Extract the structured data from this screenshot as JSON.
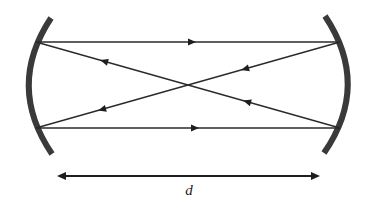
{
  "diagram": {
    "type": "optical-resonator",
    "dimension_label": "d",
    "colors": {
      "mirror": "#3a3a3a",
      "ray": "#2a2a2a",
      "background": "#ffffff"
    },
    "mirrors": [
      {
        "name": "left-mirror",
        "side": "left",
        "concave_toward": "right"
      },
      {
        "name": "right-mirror",
        "side": "right",
        "concave_toward": "left"
      }
    ],
    "rays": [
      {
        "name": "top-ray",
        "from": "left-mirror-top",
        "to": "right-mirror-top",
        "direction": "right"
      },
      {
        "name": "diagonal-ray-1",
        "from": "right-mirror-top",
        "to": "left-mirror-bottom",
        "direction": "left"
      },
      {
        "name": "diagonal-ray-2",
        "from": "right-mirror-bottom",
        "to": "left-mirror-top",
        "direction": "left"
      },
      {
        "name": "bottom-ray",
        "from": "left-mirror-bottom",
        "to": "right-mirror-bottom",
        "direction": "right"
      }
    ]
  }
}
